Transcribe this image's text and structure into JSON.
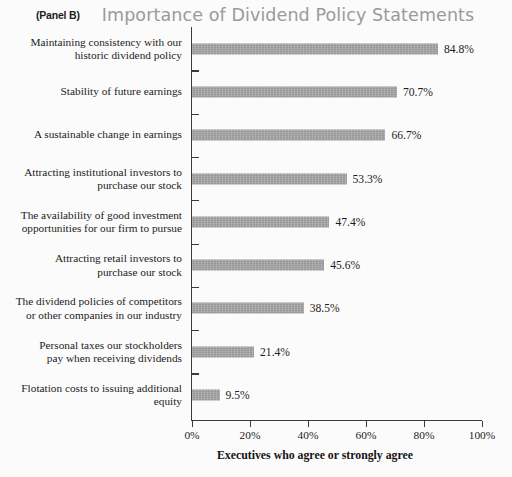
{
  "header": {
    "panel_tag": "(Panel B)",
    "title": "Importance of Dividend Policy Statements"
  },
  "chart_data": {
    "type": "bar",
    "orientation": "horizontal",
    "title": "Importance of Dividend Policy Statements",
    "panel": "(Panel B)",
    "xlabel": "Executives who agree or strongly agree",
    "ylabel": "",
    "xlim": [
      0,
      100
    ],
    "xticks": [
      0,
      20,
      40,
      60,
      80,
      100
    ],
    "xtick_labels": [
      "0%",
      "20%",
      "40%",
      "60%",
      "80%",
      "100%"
    ],
    "grid": false,
    "legend": false,
    "bar_color": "#a3a3a3",
    "categories": [
      "Maintaining consistency with our\nhistoric dividend policy",
      "Stability of future earnings",
      "A sustainable change in earnings",
      "Attracting institutional investors to\npurchase our stock",
      "The availability of good investment\nopportunities for our firm to pursue",
      "Attracting retail investors to\npurchase our stock",
      "The dividend policies of competitors\nor other companies in our industry",
      "Personal taxes our stockholders\npay when receiving dividends",
      "Flotation costs to issuing additional\nequity"
    ],
    "values": [
      84.8,
      70.7,
      66.7,
      53.3,
      47.4,
      45.6,
      38.5,
      21.4,
      9.5
    ],
    "value_labels": [
      "84.8%",
      "70.7%",
      "66.7%",
      "53.3%",
      "47.4%",
      "45.6%",
      "38.5%",
      "21.4%",
      "9.5%"
    ]
  }
}
